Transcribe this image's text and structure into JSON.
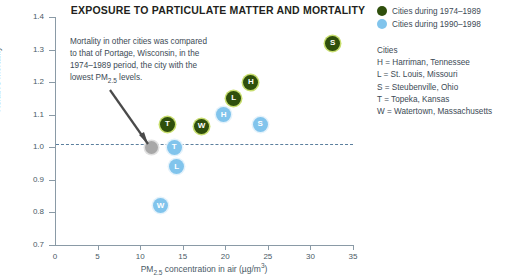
{
  "chart_data": {
    "type": "scatter",
    "title": "EXPOSURE TO PARTICULATE MATTER AND MORTALITY",
    "xlabel_prefix": "PM",
    "xlabel_sub": "2.5",
    "xlabel_mid": " concentration in air (µg/m",
    "xlabel_sup": "3",
    "xlabel_suffix": ")",
    "ylabel": "Relative mortality",
    "xlim": [
      0,
      35
    ],
    "ylim": [
      0.7,
      1.4
    ],
    "xticks": [
      0,
      5,
      10,
      15,
      20,
      25,
      30,
      35
    ],
    "yticks": [
      "1.4",
      "1.3",
      "1.2",
      "1.1",
      "1.0",
      "0.9",
      "0.8",
      "0.7"
    ],
    "grid": false,
    "legend_position": "top-right",
    "reference_line": {
      "y": 1.0,
      "style": "dashed",
      "color": "#5b7f9e"
    },
    "series": [
      {
        "name": "Cities during 1974–1989",
        "color": "#2f4f0c",
        "halo": "#c7dd6e",
        "points": [
          {
            "label": "T",
            "city": "Topeka, Kansas",
            "x": 13.2,
            "y": 1.07
          },
          {
            "label": "W",
            "city": "Watertown, Massachusetts",
            "x": 17.2,
            "y": 1.065
          },
          {
            "label": "L",
            "city": "St. Louis, Missouri",
            "x": 21.0,
            "y": 1.15
          },
          {
            "label": "H",
            "city": "Harriman, Tennessee",
            "x": 23.0,
            "y": 1.2
          },
          {
            "label": "S",
            "city": "Steubenville, Ohio",
            "x": 32.6,
            "y": 1.32
          }
        ]
      },
      {
        "name": "Cities during 1990–1998",
        "color": "#81c4ec",
        "halo": "#e4f2fb",
        "points": [
          {
            "label": "W",
            "city": "Watertown, Massachusetts",
            "x": 12.4,
            "y": 0.82
          },
          {
            "label": "T",
            "city": "Topeka, Kansas",
            "x": 14.0,
            "y": 1.0
          },
          {
            "label": "L",
            "city": "St. Louis, Missouri",
            "x": 14.3,
            "y": 0.94
          },
          {
            "label": "H",
            "city": "Harriman, Tennessee",
            "x": 19.8,
            "y": 1.1
          },
          {
            "label": "S",
            "city": "Steubenville, Ohio",
            "x": 24.1,
            "y": 1.07
          }
        ]
      },
      {
        "name": "Portage, Wisconsin (reference)",
        "color": "#a8a8a8",
        "halo": "#e0e0e0",
        "points": [
          {
            "label": "",
            "city": "Portage, Wisconsin",
            "x": 11.3,
            "y": 1.0
          }
        ]
      }
    ]
  },
  "annotation": {
    "line1": "Mortality in other cities was compared",
    "line2": "to that of Portage, Wisconsin, in the",
    "line3": "1974–1989 period, the city with the",
    "line4_prefix": "lowest PM",
    "line4_sub": "2.5",
    "line4_suffix": " levels."
  },
  "legend": {
    "entries": [
      {
        "label": "Cities during 1974–1989",
        "color": "#2f4f0c"
      },
      {
        "label": "Cities during 1990–1998",
        "color": "#81c4ec"
      }
    ],
    "key_title": "Cities",
    "key_rows": [
      "H = Harriman, Tennessee",
      "L = St. Louis, Missouri",
      "S = Steubenville, Ohio",
      "T = Topeka, Kansas",
      "W = Watertown, Massachusetts"
    ]
  }
}
